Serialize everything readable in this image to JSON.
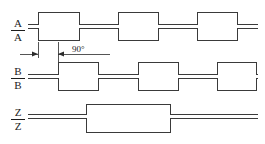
{
  "figure": {
    "type": "timing-diagram",
    "title": ""
  },
  "labels": {
    "a": "A",
    "a_not": "A",
    "b": "B",
    "b_not": "B",
    "z": "Z",
    "z_not": "Z"
  },
  "annotation": {
    "phase_text": "90°",
    "phase_value": 90,
    "phase_unit": "degrees",
    "from_marker": "A-rising-edge",
    "to_marker": "B-rising-edge"
  },
  "colors": {
    "trace": "#3a3a3a",
    "annotation": "#2b2b2b",
    "background": "#ffffff",
    "text": "#1c1c1c"
  },
  "chart_data": {
    "type": "line",
    "xlabel": "",
    "ylabel": "",
    "grid": false,
    "legend": "none",
    "xlim": [
      28,
      258
    ],
    "series": [
      {
        "name": "A",
        "row": 0,
        "level_high_y": 12,
        "level_low_y": 24,
        "initial_level": "low",
        "transitions_x": [
          38,
          79,
          118,
          158,
          197,
          237
        ],
        "levels": [
          "low",
          "high",
          "low",
          "high",
          "low",
          "high",
          "low"
        ]
      },
      {
        "name": "A-bar",
        "row": 0,
        "level_high_y": 28,
        "level_low_y": 40,
        "initial_level": "high",
        "transitions_x": [
          38,
          79,
          118,
          158,
          197,
          237
        ],
        "levels": [
          "high",
          "low",
          "high",
          "low",
          "high",
          "low",
          "high"
        ]
      },
      {
        "name": "B",
        "row": 1,
        "level_high_y": 62,
        "level_low_y": 74,
        "initial_level": "low",
        "transitions_x": [
          58,
          98,
          138,
          178,
          217,
          256
        ],
        "levels": [
          "low",
          "high",
          "low",
          "high",
          "low",
          "high",
          "low"
        ]
      },
      {
        "name": "B-bar",
        "row": 1,
        "level_high_y": 78,
        "level_low_y": 90,
        "initial_level": "high",
        "transitions_x": [
          58,
          98,
          138,
          178,
          217,
          256
        ],
        "levels": [
          "high",
          "low",
          "high",
          "low",
          "high",
          "low",
          "high"
        ]
      },
      {
        "name": "Z",
        "row": 2,
        "level_high_y": 104,
        "level_low_y": 114,
        "initial_level": "low",
        "transitions_x": [
          86,
          170
        ],
        "levels": [
          "low",
          "high",
          "low"
        ]
      },
      {
        "name": "Z-bar",
        "row": 2,
        "level_high_y": 118,
        "level_low_y": 132,
        "initial_level": "high",
        "transitions_x": [
          86,
          170
        ],
        "levels": [
          "high",
          "low",
          "high"
        ]
      }
    ]
  }
}
